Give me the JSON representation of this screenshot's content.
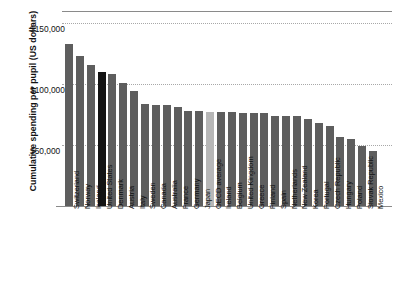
{
  "chart_data": {
    "type": "bar",
    "title": "",
    "subtitle": "",
    "xlabel": "",
    "ylabel": "Cumulative spending per pupil (US dollars)",
    "ylim": [
      0,
      160000
    ],
    "ytick_values": [
      50000,
      100000,
      150000
    ],
    "ytick_labels": [
      "$50,000",
      "$100,000",
      "$150,000"
    ],
    "grid": true,
    "grid_style": "dotted horizontal",
    "legend": "none",
    "bar_color": "#5e5e5e",
    "highlight_color": "#141414",
    "average_color": "#b7b7b7",
    "highlight_category": "United States",
    "average_category": "OECD average",
    "categories": [
      "Switzerland",
      "Norway",
      "Iceland",
      "United States",
      "Denmark",
      "Austria",
      "Italy",
      "Sweden",
      "Canada",
      "Australia",
      "France",
      "Germany",
      "Japan",
      "OECD average",
      "Ireland",
      "Belgium",
      "United Kingdom",
      "Greece",
      "Finland",
      "Spain",
      "Netherlands",
      "New Zealand",
      "Korea",
      "Portugal",
      "Czech Republic",
      "Hungary",
      "Poland",
      "Slovak Republic",
      "Mexico"
    ],
    "values": [
      133000,
      123000,
      116000,
      110000,
      108000,
      101000,
      94000,
      84000,
      83000,
      83000,
      81000,
      78000,
      78000,
      77000,
      77000,
      77000,
      76000,
      76000,
      76000,
      74000,
      74000,
      74000,
      71000,
      68000,
      66000,
      57000,
      55000,
      49000,
      45000
    ]
  }
}
